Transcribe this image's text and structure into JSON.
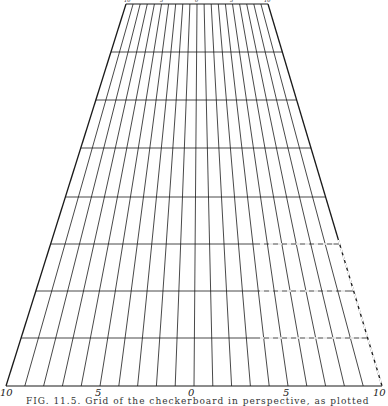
{
  "figure": {
    "type": "perspective-grid",
    "top_edge": {
      "y": 4,
      "x_left": 126,
      "x_right": 268
    },
    "bottom_edge": {
      "y": 386,
      "x_left": 6,
      "x_right": 382
    },
    "columns": 20,
    "row_lines_y": [
      4,
      52,
      100,
      148,
      197,
      244,
      291,
      338,
      386
    ],
    "line_color": "#1a1a1a",
    "dashed_overlay": {
      "vertical_x_bottom": [
        327,
        345,
        365
      ],
      "horizontal_y": [
        244,
        291,
        338
      ]
    }
  },
  "bottom_axis": {
    "labels": [
      {
        "text": "10",
        "x": 0
      },
      {
        "text": "5",
        "x": 95
      },
      {
        "text": "0",
        "x": 188
      },
      {
        "text": "5",
        "x": 283
      },
      {
        "text": "10",
        "x": 373
      }
    ]
  },
  "top_axis": {
    "labels": [
      {
        "text": "10",
        "x": 124
      },
      {
        "text": "5",
        "x": 160
      },
      {
        "text": "0",
        "x": 195
      },
      {
        "text": "5",
        "x": 230
      },
      {
        "text": "10",
        "x": 264
      }
    ]
  },
  "caption": {
    "text": "FIG. 11.5. Grid of the checkerboard in perspective, as plotted"
  }
}
